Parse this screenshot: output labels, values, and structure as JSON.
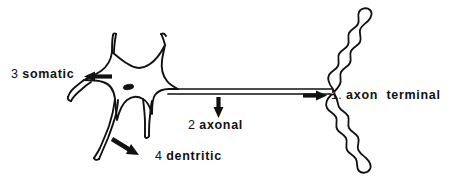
{
  "figure": {
    "background_color": "#ffffff",
    "ink_color": "#111111",
    "width": 450,
    "height": 186
  },
  "labels": {
    "axon_terminal": {
      "number": "1.",
      "term": "axon  terminal",
      "arrow": "arrow-right-icon"
    },
    "axonal": {
      "number": "2",
      "term": "axonal",
      "arrow": "arrow-down-icon"
    },
    "somatic": {
      "number": "3",
      "term": "somatic",
      "arrow": "arrow-left-icon"
    },
    "dentritic": {
      "number": "4",
      "term": "dentritic",
      "arrow": "arrow-down-right-icon"
    }
  },
  "parts": {
    "soma": "soma-cell-body",
    "nucleus": "nucleus",
    "axon": "axon-shaft",
    "terminal_upper": "axon-terminal-branch-upper",
    "terminal_lower": "axon-terminal-branch-lower",
    "dendrite_up_left": "dendrite-upper-left",
    "dendrite_up_right": "dendrite-upper-right",
    "dendrite_left": "dendrite-left",
    "dendrite_down_left": "dendrite-lower-left",
    "dendrite_down_right": "dendrite-lower-right"
  }
}
